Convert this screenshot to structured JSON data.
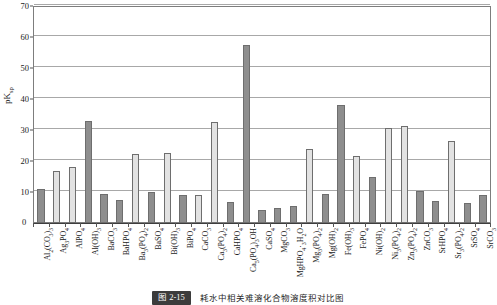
{
  "figure": {
    "caption_tag": "图 2-15",
    "caption_text": "耗水中相关难溶化合物溶度积对比图"
  },
  "chart_data": {
    "type": "bar",
    "title": "",
    "xlabel": "",
    "ylabel": "pKsp",
    "ylim": [
      0,
      70
    ],
    "yticks": [
      0,
      10,
      20,
      30,
      40,
      50,
      60,
      70
    ],
    "grid": true,
    "legend": "none",
    "bar_colors": {
      "dark": "#8e8e8e",
      "light": "#e2e2e2"
    },
    "categories": [
      "Al2(CO3)3",
      "Ag3PO4",
      "AlPO4",
      "Al(OH)3",
      "BaCO3",
      "BaHPO4",
      "Ba3(PO4)2",
      "BaSO4",
      "Bi(OH)3",
      "BiPO4",
      "CaCO3",
      "Ca3(PO4)2",
      "CaHPO4",
      "Ca5(PO4)3OH",
      "CaSO4",
      "MgCO3",
      "MgHPO4·3H2O",
      "Mg3(PO4)2",
      "Mg(OH)2",
      "Fe(OH)3",
      "FePO4",
      "Ni(OH)2",
      "Ni3(PO4)2",
      "Zn3(PO4)2",
      "ZnCO3",
      "SrHPO4",
      "Sr3(PO4)2",
      "SrSO4",
      "SrCO3"
    ],
    "values": [
      11.1,
      16.9,
      18.2,
      32.8,
      9.2,
      7.4,
      22.3,
      9.9,
      22.6,
      9.0,
      9.1,
      32.5,
      6.8,
      57.5,
      4.3,
      5.0,
      5.6,
      23.9,
      9.4,
      38.0,
      21.6,
      14.7,
      30.8,
      31.2,
      10.3,
      7.1,
      26.5,
      6.5,
      9.1
    ],
    "bar_styles": [
      "dark",
      "light",
      "light",
      "dark",
      "dark",
      "dark",
      "light",
      "dark",
      "light",
      "dark",
      "light",
      "light",
      "dark",
      "dark",
      "dark",
      "dark",
      "dark",
      "light",
      "dark",
      "dark",
      "light",
      "dark",
      "light",
      "light",
      "dark",
      "dark",
      "light",
      "dark",
      "dark"
    ]
  }
}
